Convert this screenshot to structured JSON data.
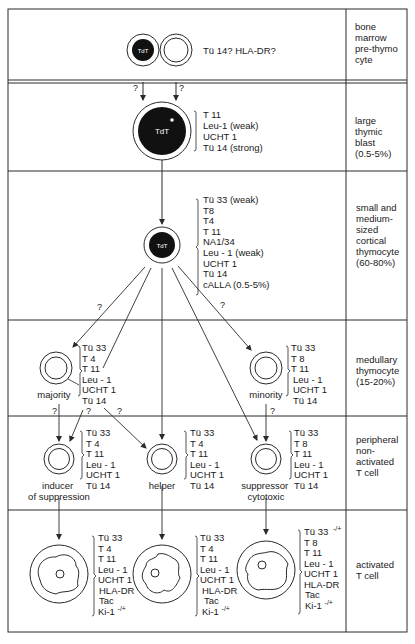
{
  "stages": [
    {
      "id": "bone-marrow",
      "label_lines": [
        "bone",
        "marrow",
        "pre-thymo",
        "cyte"
      ]
    },
    {
      "id": "large-blast",
      "label_lines": [
        "large",
        "thymic",
        "blast",
        "(0.5-5%)"
      ]
    },
    {
      "id": "cortical",
      "label_lines": [
        "small and",
        "medium-",
        "sized",
        "cortical",
        "thymocyte",
        "(60-80%)"
      ]
    },
    {
      "id": "medullary",
      "label_lines": [
        "medullary",
        "thymocyte",
        "(15-20%)"
      ]
    },
    {
      "id": "peripheral",
      "label_lines": [
        "peripheral",
        "non-",
        "activated",
        "T cell"
      ]
    },
    {
      "id": "activated",
      "label_lines": [
        "activated",
        "T cell"
      ]
    }
  ],
  "cells": {
    "prethymocyte": {
      "nucleus_label": "TdT",
      "markers": [
        "Tü 14? HLA-DR?"
      ]
    },
    "large_blast": {
      "nucleus_label": "TdT",
      "markers": [
        "T 11",
        "Leu-1 (weak)",
        "UCHT 1",
        "Tü 14 (strong)"
      ]
    },
    "cortical": {
      "nucleus_label": "TdT",
      "markers": [
        "Tü 33 (weak)",
        "T8",
        "T4",
        "T 11",
        "NA1/34",
        "Leu - 1 (weak)",
        "UCHT 1",
        "Tü 14",
        "cALLA (0.5-5%)"
      ]
    },
    "majority": {
      "name": "majority",
      "markers": [
        "Tü 33",
        "T 4",
        "T 11",
        "Leu - 1",
        "UCHT 1",
        "Tü 14"
      ]
    },
    "minority": {
      "name": "minority",
      "markers": [
        "Tü 33",
        "T 8",
        "T 11",
        "Leu - 1",
        "UCHT 1",
        "Tü 14"
      ]
    },
    "inducer": {
      "name_lines": [
        "inducer",
        "of suppression"
      ],
      "markers": [
        "Tü 33",
        "T 4",
        "T 11",
        "Leu - 1",
        "UCHT 1",
        "Tü 14"
      ]
    },
    "helper": {
      "name_lines": [
        "helper"
      ],
      "markers": [
        "Tü 33",
        "T 4",
        "T 11",
        "Leu - 1",
        "UCHT 1",
        "Tü 14"
      ]
    },
    "suppressor": {
      "name_lines": [
        "suppressor",
        "cytotoxic"
      ],
      "markers": [
        "Tü 33",
        "T 8",
        "T 11",
        "Leu - 1",
        "UCHT 1",
        "Tü 14"
      ]
    },
    "act_inducer": {
      "markers": [
        "Tü 33",
        "T 4",
        "T 11",
        "Leu - 1",
        "UCHT 1",
        "HLA-DR",
        "Tac",
        "Ki-1"
      ],
      "superscripts": {
        "7": "-/+"
      }
    },
    "act_helper": {
      "markers": [
        "Tü 33",
        "T 4",
        "T 11",
        "Leu - 1",
        "UCHT 1",
        "HLA-DR",
        "Tac",
        "Ki-1"
      ],
      "superscripts": {
        "7": "-/+"
      }
    },
    "act_suppressor": {
      "markers": [
        "Tü 33",
        "T 8",
        "T 11",
        "Leu - 1",
        "UCHT 1",
        "HLA-DR",
        "Tac",
        "Ki-1"
      ],
      "superscripts": {
        "0": "-/+",
        "7": "-/+"
      }
    }
  },
  "uncertain_mark": "?",
  "colors": {
    "line": "#2a2a2a",
    "nucleus": "#111111",
    "background": "#ffffff"
  }
}
